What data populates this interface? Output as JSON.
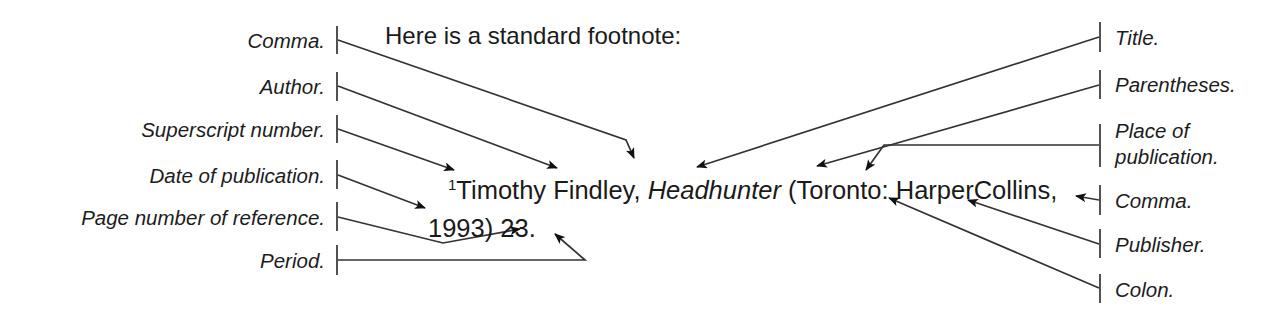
{
  "figure": {
    "heading": "Here is a standard footnote:",
    "background_color": "#ffffff",
    "ink_color": "#1a1a1a"
  },
  "footnote": {
    "superscript": "1",
    "author": "Timothy Findley, ",
    "title": "Headhunter",
    "parenthetical_open": " (",
    "place": "Toronto",
    "colon": ": ",
    "publisher": "HarperCollins",
    "comma": ",",
    "line2_year": "1993",
    "line2_paren_close": ") ",
    "line2_page": "23",
    "line2_period": ".",
    "full_text": "1Timothy Findley, Headhunter (Toronto: HarperCollins, 1993) 23."
  },
  "left_labels": [
    {
      "text": "Comma.",
      "points_to": "comma after Findley"
    },
    {
      "text": "Author.",
      "points_to": "Timothy Findley"
    },
    {
      "text": "Superscript number.",
      "points_to": "superscript 1"
    },
    {
      "text": "Date of publication.",
      "points_to": "1993"
    },
    {
      "text": "Page number of reference.",
      "points_to": "23"
    },
    {
      "text": "Period.",
      "points_to": "final period"
    }
  ],
  "right_labels": [
    {
      "text": "Title.",
      "points_to": "Headhunter"
    },
    {
      "text": "Parentheses.",
      "points_to": "opening parenthesis"
    },
    {
      "text": "Place of\npublication.",
      "points_to": "Toronto"
    },
    {
      "text": "Comma.",
      "points_to": "comma after HarperCollins"
    },
    {
      "text": "Publisher.",
      "points_to": "HarperCollins"
    },
    {
      "text": "Colon.",
      "points_to": "colon after Toronto"
    }
  ]
}
